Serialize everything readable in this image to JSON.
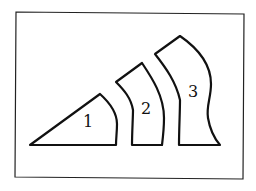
{
  "figure": {
    "frame": {
      "x1": 16,
      "y1": 12,
      "x2": 244,
      "y2": 178,
      "color": "#222222"
    },
    "stroke_color": "#111111",
    "shapes": [
      {
        "id": 1,
        "label": "1",
        "description": "triangular wedge with curved right edge",
        "label_pos": [
          88,
          122
        ]
      },
      {
        "id": 2,
        "label": "2",
        "description": "curved band segment",
        "label_pos": [
          146,
          109
        ]
      },
      {
        "id": 3,
        "label": "3",
        "description": "tall curved segment with pinched right edge",
        "label_pos": [
          193,
          92
        ]
      }
    ]
  }
}
